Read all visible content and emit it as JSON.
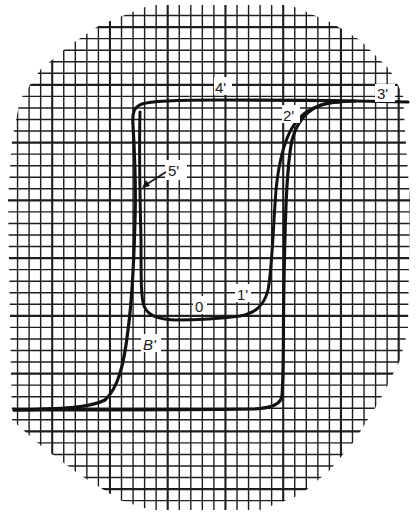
{
  "chart_data": {
    "type": "line",
    "title": "",
    "xlabel": "",
    "ylabel": "",
    "grid": true,
    "grid_style": "graph paper, circular clipped region",
    "series": [
      {
        "name": "outer-loop-descending",
        "points": [
          [
            403,
            101
          ],
          [
            355,
            101
          ],
          [
            220,
            100
          ],
          [
            145,
            102
          ],
          [
            133,
            110
          ],
          [
            135,
            170
          ],
          [
            133,
            260
          ],
          [
            128,
            330
          ],
          [
            120,
            380
          ],
          [
            100,
            406
          ],
          [
            14,
            410
          ]
        ]
      },
      {
        "name": "outer-loop-ascending",
        "points": [
          [
            14,
            410
          ],
          [
            110,
            410
          ],
          [
            265,
            408
          ],
          [
            282,
            398
          ],
          [
            283,
            340
          ],
          [
            285,
            220
          ],
          [
            295,
            130
          ],
          [
            320,
            104
          ],
          [
            355,
            101
          ],
          [
            403,
            101
          ]
        ]
      },
      {
        "name": "inner-minor-loop",
        "points": [
          [
            140,
            120
          ],
          [
            141,
            280
          ],
          [
            145,
            310
          ],
          [
            170,
            319
          ],
          [
            230,
            317
          ],
          [
            260,
            308
          ],
          [
            272,
            270
          ],
          [
            278,
            180
          ],
          [
            290,
            130
          ],
          [
            315,
            105
          ],
          [
            355,
            101
          ]
        ]
      }
    ],
    "annotations": [
      {
        "text": "0",
        "x": 201,
        "y": 308
      },
      {
        "text": "1'",
        "x": 243,
        "y": 296
      },
      {
        "text": "2'",
        "x": 288,
        "y": 118
      },
      {
        "text": "3'",
        "x": 387,
        "y": 98
      },
      {
        "text": "4'",
        "x": 222,
        "y": 92
      },
      {
        "text": "5'",
        "x": 170,
        "y": 170
      },
      {
        "text": "B'",
        "x": 150,
        "y": 348
      }
    ]
  },
  "labels": {
    "zero": "0",
    "one": "1'",
    "two": "2'",
    "three": "3'",
    "four": "4'",
    "five": "5'",
    "b_prime": "B'"
  }
}
